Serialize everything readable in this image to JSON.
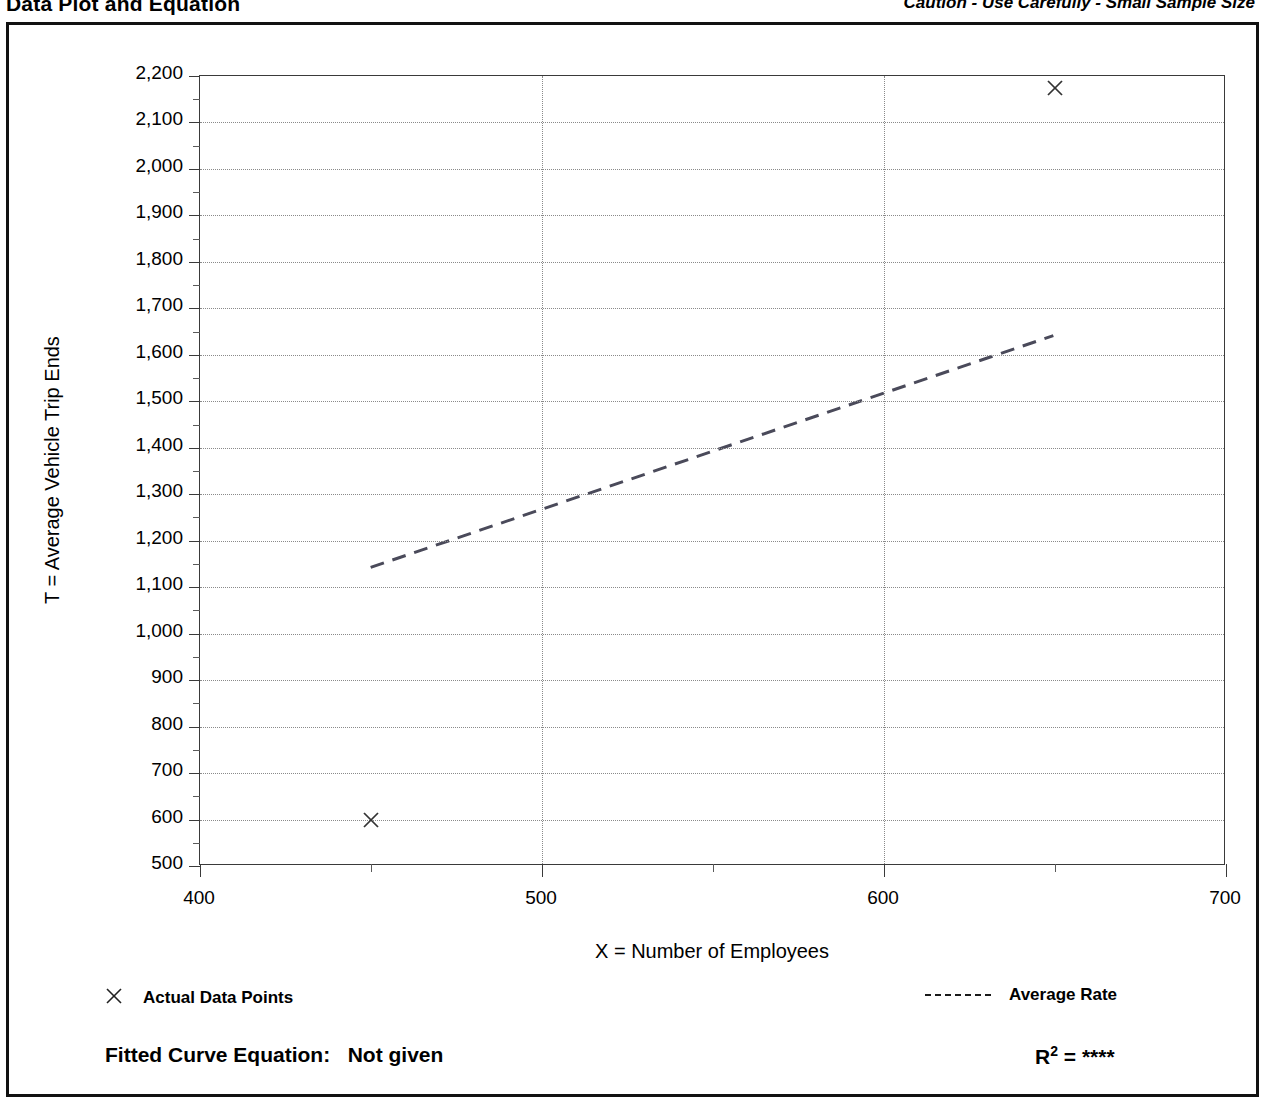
{
  "header": {
    "title": "Data Plot and Equation",
    "caution": "Caution - Use Carefully - Small Sample Size"
  },
  "legend": {
    "data_points_marker": "x-marker-icon",
    "data_points_label": "Actual Data Points",
    "average_rate_marker": "dashed-line-icon",
    "average_rate_label": "Average Rate"
  },
  "footer": {
    "equation_label": "Fitted Curve Equation:",
    "equation_value": "Not given",
    "r2_label": "R",
    "r2_exponent": "2",
    "r2_equals": "=",
    "r2_value": "****"
  },
  "chart_data": {
    "type": "scatter",
    "title": "Data Plot and Equation",
    "xlabel": "X = Number of Employees",
    "ylabel": "T = Average Vehicle Trip Ends",
    "xlim": [
      400,
      700
    ],
    "ylim": [
      500,
      2200
    ],
    "x_major_ticks": [
      400,
      500,
      600,
      700
    ],
    "x_major_tick_labels": [
      "400",
      "500",
      "600",
      "700"
    ],
    "x_minor_ticks": [
      450,
      550,
      650
    ],
    "y_major_ticks": [
      500,
      600,
      700,
      800,
      900,
      1000,
      1100,
      1200,
      1300,
      1400,
      1500,
      1600,
      1700,
      1800,
      1900,
      2000,
      2100,
      2200
    ],
    "y_major_tick_labels": [
      "500",
      "600",
      "700",
      "800",
      "900",
      "1,000",
      "1,100",
      "1,200",
      "1,300",
      "1,400",
      "1,500",
      "1,600",
      "1,700",
      "1,800",
      "1,900",
      "2,000",
      "2,100",
      "2,200"
    ],
    "y_minor_ticks": [
      550,
      650,
      750,
      850,
      950,
      1050,
      1150,
      1250,
      1350,
      1450,
      1550,
      1650,
      1750,
      1850,
      1950,
      2050,
      2150
    ],
    "grid": true,
    "grid_style": "dotted",
    "legend_position": "below-plot",
    "series": [
      {
        "name": "Actual Data Points",
        "type": "scatter",
        "marker": "x",
        "points": [
          {
            "x": 450,
            "y": 600
          },
          {
            "x": 650,
            "y": 2175
          }
        ]
      },
      {
        "name": "Average Rate",
        "type": "line",
        "style": "dashed",
        "points": [
          {
            "x": 450,
            "y": 1140
          },
          {
            "x": 650,
            "y": 1640
          }
        ]
      }
    ]
  }
}
